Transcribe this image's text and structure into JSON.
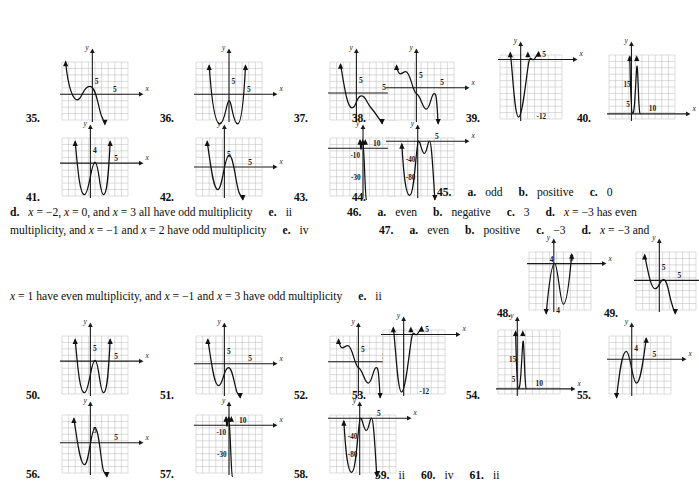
{
  "page": {
    "type": "textbook-answer-key",
    "background": "#ffffff",
    "ink": "#0d0d0d",
    "grid_color": "#b9b9b9",
    "axis_color": "#1a1a1a"
  },
  "figures": [
    {
      "num": "35.",
      "num_x": 26,
      "num_y": 112,
      "x": 62,
      "y": 62,
      "w": 66,
      "h": 58,
      "cols": 10,
      "rows": 9,
      "ox": 4.6,
      "oy": 4.0,
      "xlabel": "x",
      "ylabel": "y",
      "xtick": "5",
      "ytick": "5",
      "xtick_pos": 8.0,
      "ytick_pos": 6.0,
      "curve": "M 0.55,9.0 C 0.9,5.2 1.7,2.7 2.5,3.2 C 3.2,3.7 3.2,5.1 4.2,5.2 C 5.3,5.3 5.6,0.9 6.1,0.4 L 6.5,-0.6",
      "arrows": [
        {
          "x": 0.55,
          "y": 9.0,
          "dir": "up"
        },
        {
          "x": 6.5,
          "y": -0.6,
          "dir": "down"
        }
      ]
    },
    {
      "num": "36.",
      "num_x": 160,
      "num_y": 112,
      "x": 196,
      "y": 62,
      "w": 66,
      "h": 58,
      "cols": 10,
      "rows": 9,
      "ox": 5.0,
      "oy": 4.0,
      "xlabel": "x",
      "ylabel": "y",
      "xtick": "5",
      "ytick": "5",
      "xtick_pos": 8.0,
      "ytick_pos": 6.0,
      "curve": "M 2.0,8.4 C 2.3,4.0 2.8,-0.6 3.6,-0.6 C 4.4,-0.6 4.6,2.9 5.0,3.0 C 5.4,3.1 5.6,-0.6 6.3,-0.6 C 7.0,-0.6 7.3,4.2 7.5,8.4",
      "arrows": [
        {
          "x": 2.0,
          "y": 8.4,
          "dir": "up"
        },
        {
          "x": 7.5,
          "y": 8.4,
          "dir": "up"
        }
      ]
    },
    {
      "num": "37.",
      "num_x": 294,
      "num_y": 112,
      "x": 330,
      "y": 62,
      "w": 66,
      "h": 58,
      "cols": 10,
      "rows": 9,
      "ox": 4.0,
      "oy": 4.2,
      "xlabel": "x",
      "ylabel": "y",
      "xtick": "5",
      "ytick": "5",
      "xtick_pos": 8.2,
      "ytick_pos": 6.2,
      "curve": "M 1.6,8.6 C 2.2,5.0 2.6,2.0 3.3,1.9 C 4.0,1.8 3.9,3.4 4.6,3.7 C 5.3,4.0 5.6,2.6 6.2,1.9 C 6.9,1.1 7.4,0.2 7.9,-0.5",
      "arrows": [
        {
          "x": 1.6,
          "y": 8.6,
          "dir": "up"
        },
        {
          "x": 7.9,
          "y": -0.5,
          "dir": "down"
        }
      ]
    },
    {
      "num": "38.",
      "num_x": 352,
      "num_y": 112,
      "x": 388,
      "y": 62,
      "w": 66,
      "h": 58,
      "cols": 10,
      "rows": 9,
      "ox": 4.3,
      "oy": 5.0,
      "xlabel": "x",
      "ylabel": "y",
      "xtick": "5",
      "ytick": "5",
      "xtick_pos": 8.2,
      "ytick_pos": 7.0,
      "curve": "M 1.3,8.4 C 1.7,6.3 2.1,7.5 2.7,7.5 C 3.4,7.5 3.7,4.4 4.3,4.1 C 5.0,3.8 5.2,1.7 5.8,1.7 C 6.4,1.7 6.5,4.0 7.0,4.1 C 7.4,4.2 7.4,2.3 7.6,-0.5",
      "arrows": [
        {
          "x": 1.3,
          "y": 8.4,
          "dir": "up"
        },
        {
          "x": 7.6,
          "y": -0.5,
          "dir": "down"
        }
      ]
    },
    {
      "num": "39.",
      "num_x": 466,
      "num_y": 112,
      "x": 500,
      "y": 55,
      "w": 62,
      "h": 64,
      "cols": 9,
      "rows": 10,
      "ox": 3.0,
      "oy": 9.3,
      "xlabel": "x",
      "ylabel": "y",
      "xtick": "5",
      "ytick": "",
      "xtick_pos": 6.4,
      "ytick_pos": 0,
      "extra_labels": [
        {
          "text": "-12",
          "x": 5.3,
          "y": 0.5
        }
      ],
      "curve": "M 1.5,10.3 C 1.8,8.0 2.1,0.3 2.7,0.3 C 3.3,0.3 3.9,7.6 4.2,9.0 C 4.45,10.0 4.6,9.1 4.9,9.3 C 5.2,9.5 5.4,10.2 5.6,10.4",
      "arrows": [
        {
          "x": 1.5,
          "y": 10.3,
          "dir": "up"
        },
        {
          "x": 4.05,
          "y": 10.3,
          "dir": "up"
        },
        {
          "x": 5.6,
          "y": 10.4,
          "dir": "up"
        }
      ]
    },
    {
      "num": "40.",
      "num_x": 577,
      "num_y": 112,
      "x": 609,
      "y": 55,
      "w": 66,
      "h": 64,
      "cols": 10,
      "rows": 10,
      "ox": 3.4,
      "oy": 0.8,
      "xlabel": "x",
      "ylabel": "y",
      "xtick": "10",
      "ytick": "",
      "xtick_pos": 6.6,
      "ytick_pos": 0,
      "extra_labels": [
        {
          "text": "15",
          "x": 2.2,
          "y": 5.4
        },
        {
          "text": "5",
          "x": 2.6,
          "y": 2.4
        }
      ],
      "curve": "M 3.15,9.7 C 3.25,6.0 3.3,0.9 3.6,0.85 C 3.9,0.8 4.05,6.0 4.2,8.0 C 4.3,9.2 4.4,6.0 4.5,3.0 C 4.6,1.5 4.62,0.9 4.7,0.85",
      "arrows": [
        {
          "x": 3.15,
          "y": 9.7,
          "dir": "up"
        },
        {
          "x": 4.2,
          "y": 9.7,
          "dir": "up"
        }
      ]
    },
    {
      "num": "41.",
      "num_x": 26,
      "num_y": 191,
      "x": 62,
      "y": 138,
      "w": 66,
      "h": 58,
      "cols": 10,
      "rows": 9,
      "ox": 4.3,
      "oy": 5.1,
      "xlabel": "x",
      "ylabel": "y",
      "xtick": "5",
      "ytick": "4",
      "xtick_pos": 8.2,
      "ytick_pos": 7.1,
      "curve": "M 2.0,8.4 C 2.4,4.0 2.7,0.2 3.4,0.2 C 4.1,0.2 4.4,5.2 5.0,5.2 C 5.6,5.2 5.7,0.2 6.3,0.2 C 6.9,0.2 7.1,4.5 7.3,8.4",
      "arrows": [
        {
          "x": 2.0,
          "y": 8.4,
          "dir": "up"
        },
        {
          "x": 7.3,
          "y": 8.4,
          "dir": "up"
        }
      ]
    },
    {
      "num": "42.",
      "num_x": 160,
      "num_y": 191,
      "x": 196,
      "y": 138,
      "w": 66,
      "h": 58,
      "cols": 10,
      "rows": 9,
      "ox": 4.3,
      "oy": 4.5,
      "xlabel": "x",
      "ylabel": "y",
      "xtick": "5",
      "ytick": "5",
      "xtick_pos": 8.2,
      "ytick_pos": 6.5,
      "curve": "M 1.7,8.4 C 2.2,5.0 2.6,1.0 3.3,1.0 C 4.0,1.0 4.3,6.2 5.0,6.3 C 5.7,6.4 6.0,2.0 6.5,0.6 C 6.9,-0.3 7.0,-0.4 7.1,-0.5",
      "arrows": [
        {
          "x": 1.7,
          "y": 8.4,
          "dir": "up"
        },
        {
          "x": 7.1,
          "y": -0.5,
          "dir": "down"
        }
      ]
    },
    {
      "num": "43.",
      "num_x": 294,
      "num_y": 191,
      "x": 330,
      "y": 138,
      "w": 66,
      "h": 58,
      "cols": 10,
      "rows": 9,
      "ox": 5.0,
      "oy": 7.4,
      "xlabel": "x",
      "ylabel": "y",
      "xtick": "10",
      "ytick": "",
      "xtick_pos": 7.1,
      "ytick_pos": 0,
      "extra_labels": [
        {
          "text": "-10",
          "x": 3.1,
          "y": 6.3
        },
        {
          "text": "-30",
          "x": 3.2,
          "y": 3.0
        }
      ],
      "curve": "M 4.55,8.6 C 4.62,7.9 4.65,7.0 4.72,7.35 C 4.8,7.7 4.85,8.5 4.95,8.5 C 5.05,8.5 5.1,7.3 5.2,5.0 C 5.3,2.6 5.4,-0.4 5.5,-0.5",
      "arrows": [
        {
          "x": 4.55,
          "y": 8.6,
          "dir": "up"
        },
        {
          "x": 4.95,
          "y": 8.6,
          "dir": "up"
        },
        {
          "x": 5.35,
          "y": 8.6,
          "dir": "up"
        }
      ]
    },
    {
      "num": "44.",
      "num_x": 352,
      "num_y": 191,
      "x": 388,
      "y": 138,
      "w": 66,
      "h": 58,
      "cols": 10,
      "rows": 9,
      "ox": 4.5,
      "oy": 8.5,
      "xlabel": "x",
      "ylabel": "y",
      "xtick": "5",
      "ytick": "",
      "xtick_pos": 7.4,
      "ytick_pos": 0,
      "extra_labels": [
        {
          "text": "-40",
          "x": 2.7,
          "y": 5.7
        },
        {
          "text": "-80",
          "x": 2.7,
          "y": 3.0
        }
      ],
      "curve": "M 2.1,8.0 C 2.3,4.5 2.6,0.1 3.3,0.1 C 4.0,0.1 4.3,8.3 4.6,8.5 C 4.9,8.7 5.1,6.6 5.5,6.6 C 5.9,6.6 6.0,8.5 6.3,8.5 C 6.6,8.5 6.8,4.0 7.1,-0.5",
      "arrows": [
        {
          "x": 2.1,
          "y": 8.0,
          "dir": "up"
        },
        {
          "x": 7.1,
          "y": -0.5,
          "dir": "down"
        }
      ]
    },
    {
      "num": "48.",
      "num_x": 497,
      "num_y": 307,
      "x": 529,
      "y": 252,
      "w": 62,
      "h": 58,
      "cols": 9,
      "rows": 9,
      "ox": 3.6,
      "oy": 7.2,
      "xlabel": "x",
      "ylabel": "y",
      "xtick": "5",
      "ytick": "4",
      "xtick_pos": 6.2,
      "ytick_pos": 0,
      "extra_labels": [
        {
          "text": "4",
          "x": 3.0,
          "y": 7.9
        }
      ],
      "curve": "M 2.5,-0.5 C 2.8,3.0 3.2,7.2 3.7,7.25 C 4.2,7.3 4.5,0.9 5.0,0.9 C 5.5,0.9 5.9,4.9 6.2,8.6",
      "arrows": [
        {
          "x": 2.5,
          "y": -0.5,
          "dir": "down"
        },
        {
          "x": 6.2,
          "y": 8.6,
          "dir": "up"
        }
      ]
    },
    {
      "num": "49.",
      "num_x": 604,
      "num_y": 307,
      "x": 636,
      "y": 252,
      "w": 60,
      "h": 58,
      "cols": 9,
      "rows": 9,
      "ox": 3.5,
      "oy": 4.6,
      "xlabel": "x",
      "ylabel": "y",
      "xtick": "5",
      "ytick": "5",
      "xtick_pos": 6.5,
      "ytick_pos": 6.6,
      "curve": "M 1.3,8.5 C 1.9,5.4 2.3,3.2 2.9,3.3 C 3.5,3.4 3.5,4.6 4.1,4.7 C 4.7,4.8 4.9,2.6 5.3,1.2 C 5.6,0.1 5.8,-0.3 5.9,-0.5",
      "arrows": [
        {
          "x": 1.3,
          "y": 8.5,
          "dir": "up"
        },
        {
          "x": 5.9,
          "y": -0.5,
          "dir": "down"
        }
      ]
    },
    {
      "num": "50.",
      "num_x": 26,
      "num_y": 389,
      "x": 62,
      "y": 336,
      "w": 66,
      "h": 58,
      "cols": 10,
      "rows": 9,
      "ox": 4.3,
      "oy": 5.1,
      "xlabel": "x",
      "ylabel": "y",
      "xtick": "5",
      "ytick": "5",
      "xtick_pos": 8.2,
      "ytick_pos": 7.1,
      "curve": "M 2.0,8.4 C 2.4,4.0 2.7,0.2 3.4,0.2 C 4.1,0.2 4.4,5.2 5.0,5.2 C 5.6,5.2 5.7,0.2 6.3,0.2 C 6.9,0.2 7.1,4.5 7.3,8.4",
      "arrows": [
        {
          "x": 2.0,
          "y": 8.4,
          "dir": "up"
        },
        {
          "x": 7.3,
          "y": 8.4,
          "dir": "up"
        }
      ]
    },
    {
      "num": "51.",
      "num_x": 160,
      "num_y": 389,
      "x": 196,
      "y": 336,
      "w": 66,
      "h": 58,
      "cols": 10,
      "rows": 9,
      "ox": 4.3,
      "oy": 4.7,
      "xlabel": "x",
      "ylabel": "y",
      "xtick": "5",
      "ytick": "5",
      "xtick_pos": 8.2,
      "ytick_pos": 6.7,
      "curve": "M 1.8,8.4 C 2.3,5.3 2.7,1.3 3.4,1.3 C 4.1,1.3 4.2,4.0 4.9,4.1 C 5.5,4.2 5.8,1.5 6.2,0.3 C 6.5,-0.3 6.6,-0.4 6.7,-0.5",
      "arrows": [
        {
          "x": 1.8,
          "y": 8.4,
          "dir": "up"
        },
        {
          "x": 6.7,
          "y": -0.5,
          "dir": "down"
        }
      ]
    },
    {
      "num": "52.",
      "num_x": 294,
      "num_y": 389,
      "x": 330,
      "y": 336,
      "w": 66,
      "h": 58,
      "cols": 10,
      "rows": 9,
      "ox": 4.3,
      "oy": 5.0,
      "xlabel": "x",
      "ylabel": "y",
      "xtick": "5",
      "ytick": "5",
      "xtick_pos": 8.2,
      "ytick_pos": 7.0,
      "curve": "M 1.3,8.4 C 1.7,6.3 2.1,7.5 2.7,7.5 C 3.4,7.5 3.7,4.4 4.3,4.1 C 5.0,3.8 5.2,1.7 5.8,1.7 C 6.4,1.7 6.5,4.0 7.0,4.1 C 7.4,4.2 7.4,2.3 7.6,-0.5",
      "arrows": [
        {
          "x": 1.3,
          "y": 8.4,
          "dir": "up"
        },
        {
          "x": 7.6,
          "y": -0.5,
          "dir": "down"
        }
      ]
    },
    {
      "num": "53.",
      "num_x": 352,
      "num_y": 389,
      "x": 383,
      "y": 330,
      "w": 62,
      "h": 64,
      "cols": 9,
      "rows": 10,
      "ox": 3.0,
      "oy": 9.3,
      "xlabel": "x",
      "ylabel": "y",
      "xtick": "5",
      "ytick": "",
      "xtick_pos": 6.4,
      "ytick_pos": 0,
      "extra_labels": [
        {
          "text": "-12",
          "x": 5.3,
          "y": 0.5
        }
      ],
      "curve": "M 1.5,10.3 C 1.8,8.0 2.1,0.3 2.7,0.3 C 3.3,0.3 3.9,7.6 4.2,9.0 C 4.45,10.0 4.6,9.1 4.9,9.3 C 5.2,9.5 5.4,10.2 5.6,10.4",
      "arrows": [
        {
          "x": 1.5,
          "y": 10.3,
          "dir": "up"
        },
        {
          "x": 4.05,
          "y": 10.3,
          "dir": "up"
        },
        {
          "x": 5.6,
          "y": 10.4,
          "dir": "up"
        }
      ]
    },
    {
      "num": "54.",
      "num_x": 466,
      "num_y": 389,
      "x": 498,
      "y": 330,
      "w": 62,
      "h": 64,
      "cols": 9,
      "rows": 10,
      "ox": 2.8,
      "oy": 0.8,
      "xlabel": "x",
      "ylabel": "y",
      "xtick": "10",
      "ytick": "",
      "xtick_pos": 6.0,
      "ytick_pos": 0,
      "extra_labels": [
        {
          "text": "15",
          "x": 1.6,
          "y": 5.4
        },
        {
          "text": "5",
          "x": 2.0,
          "y": 2.4
        }
      ],
      "curve": "M 2.55,9.7 C 2.65,6.0 2.7,0.9 3.0,0.85 C 3.3,0.8 3.45,6.0 3.6,8.0 C 3.7,9.2 3.8,6.0 3.9,3.0 C 4.0,1.5 4.02,0.9 4.1,0.85",
      "arrows": [
        {
          "x": 2.55,
          "y": 9.7,
          "dir": "up"
        },
        {
          "x": 3.6,
          "y": 9.7,
          "dir": "up"
        }
      ]
    },
    {
      "num": "55.",
      "num_x": 577,
      "num_y": 389,
      "x": 609,
      "y": 336,
      "w": 62,
      "h": 58,
      "cols": 9,
      "rows": 9,
      "ox": 3.3,
      "oy": 5.4,
      "xlabel": "x",
      "ylabel": "y",
      "xtick": "5",
      "ytick": "4",
      "xtick_pos": 6.6,
      "ytick_pos": 7.2,
      "curve": "M 1.1,-0.5 C 1.5,3.2 1.9,6.6 2.5,6.6 C 3.1,6.6 3.4,1.7 4.0,1.7 C 4.6,1.7 5.0,5.5 5.4,8.6",
      "arrows": [
        {
          "x": 1.1,
          "y": -0.5,
          "dir": "down"
        },
        {
          "x": 5.4,
          "y": 8.6,
          "dir": "up"
        }
      ]
    },
    {
      "num": "56.",
      "num_x": 26,
      "num_y": 468,
      "x": 62,
      "y": 415,
      "w": 66,
      "h": 58,
      "cols": 10,
      "rows": 9,
      "ox": 4.3,
      "oy": 4.7,
      "xlabel": "x",
      "ylabel": "y",
      "xtick": "5",
      "ytick": "5",
      "xtick_pos": 8.2,
      "ytick_pos": 6.7,
      "curve": "M 1.8,8.4 C 2.3,5.3 2.7,1.3 3.4,1.3 C 4.1,1.3 4.4,7.0 5.0,7.0 C 5.6,7.0 5.9,1.5 6.3,0.3 C 6.6,-0.3 6.7,-0.4 6.8,-0.5",
      "arrows": [
        {
          "x": 1.8,
          "y": 8.4,
          "dir": "up"
        },
        {
          "x": 6.8,
          "y": -0.5,
          "dir": "down"
        }
      ]
    },
    {
      "num": "57.",
      "num_x": 160,
      "num_y": 468,
      "x": 196,
      "y": 415,
      "w": 66,
      "h": 58,
      "cols": 10,
      "rows": 9,
      "ox": 5.0,
      "oy": 7.4,
      "xlabel": "x",
      "ylabel": "y",
      "xtick": "10",
      "ytick": "",
      "xtick_pos": 7.1,
      "ytick_pos": 0,
      "extra_labels": [
        {
          "text": "-10",
          "x": 3.1,
          "y": 6.3
        },
        {
          "text": "-30",
          "x": 3.2,
          "y": 3.0
        }
      ],
      "curve": "M 4.55,8.6 C 4.62,7.9 4.65,7.0 4.72,7.35 C 4.8,7.7 4.85,8.5 4.95,8.5 C 5.05,8.5 5.1,7.3 5.2,5.0 C 5.3,2.6 5.4,-0.4 5.5,-0.5",
      "arrows": [
        {
          "x": 4.55,
          "y": 8.6,
          "dir": "up"
        },
        {
          "x": 4.95,
          "y": 8.6,
          "dir": "up"
        },
        {
          "x": 5.35,
          "y": 8.6,
          "dir": "up"
        }
      ]
    },
    {
      "num": "58.",
      "num_x": 294,
      "num_y": 468,
      "x": 330,
      "y": 415,
      "w": 66,
      "h": 58,
      "cols": 10,
      "rows": 9,
      "ox": 4.5,
      "oy": 8.5,
      "xlabel": "x",
      "ylabel": "y",
      "xtick": "5",
      "ytick": "",
      "xtick_pos": 7.4,
      "ytick_pos": 0,
      "extra_labels": [
        {
          "text": "-40",
          "x": 2.7,
          "y": 5.7
        },
        {
          "text": "-80",
          "x": 2.7,
          "y": 3.0
        }
      ],
      "curve": "M 2.1,8.0 C 2.3,4.5 2.6,0.1 3.3,0.1 C 4.0,0.1 4.3,8.3 4.6,8.5 C 4.9,8.7 5.1,6.6 5.5,6.6 C 5.9,6.6 6.0,8.5 6.3,8.5 C 6.6,8.5 6.8,4.0 7.1,-0.5",
      "arrows": [
        {
          "x": 2.1,
          "y": 8.0,
          "dir": "up"
        },
        {
          "x": 7.1,
          "y": -0.5,
          "dir": "down"
        }
      ]
    }
  ],
  "answers": [
    {
      "id": "a45",
      "x": 437,
      "y": 186,
      "parts": [
        {
          "label": "45.",
          "value": ""
        },
        {
          "label": "a.",
          "value": "odd"
        },
        {
          "label": "b.",
          "value": "positive"
        },
        {
          "label": "c.",
          "value": "0"
        }
      ]
    },
    {
      "id": "a45d",
      "x": 10,
      "y": 206,
      "parts": [
        {
          "label": "d.",
          "value": "x = −2, x = 0, and x = 3 all have odd multiplicity"
        },
        {
          "label": "e.",
          "value": "ii"
        }
      ]
    },
    {
      "id": "a46",
      "x": 347,
      "y": 206,
      "parts": [
        {
          "label": "46.",
          "value": ""
        },
        {
          "label": "a.",
          "value": "even"
        },
        {
          "label": "b.",
          "value": "negative"
        },
        {
          "label": "c.",
          "value": "3"
        },
        {
          "label": "d.",
          "value": "x = −3 has even"
        }
      ]
    },
    {
      "id": "a46cont",
      "x": 10,
      "y": 224,
      "parts": [
        {
          "label": "",
          "value": "multiplicity, and x = −1 and x = 2 have odd multiplicity"
        },
        {
          "label": "e.",
          "value": "iv"
        }
      ]
    },
    {
      "id": "a47",
      "x": 379,
      "y": 224,
      "parts": [
        {
          "label": "47.",
          "value": ""
        },
        {
          "label": "a.",
          "value": "even"
        },
        {
          "label": "b.",
          "value": "positive"
        },
        {
          "label": "c.",
          "value": "−3"
        },
        {
          "label": "d.",
          "value": "x = −3 and"
        }
      ]
    },
    {
      "id": "a47cont",
      "x": 10,
      "y": 290,
      "parts": [
        {
          "label": "",
          "value": "x = 1 have even multiplicity, and x = −1 and x = 3 have odd multiplicity"
        },
        {
          "label": "e.",
          "value": "ii"
        }
      ]
    },
    {
      "id": "a59",
      "x": 375,
      "y": 469,
      "parts": [
        {
          "label": "59.",
          "value": "ii"
        },
        {
          "label": "60.",
          "value": "iv"
        },
        {
          "label": "61.",
          "value": "ii"
        }
      ]
    }
  ]
}
